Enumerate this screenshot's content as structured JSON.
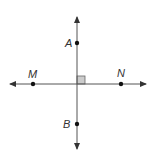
{
  "diagram": {
    "type": "perpendicular-lines",
    "colors": {
      "line": "#555555",
      "point": "#111111",
      "right_angle_fill": "#cccccc",
      "right_angle_stroke": "#666666",
      "label": "#333333"
    },
    "points": [
      {
        "label": "A",
        "x": 77,
        "y": 43,
        "label_x": 66,
        "label_y": 47
      },
      {
        "label": "B",
        "x": 77,
        "y": 124,
        "label_x": 63,
        "label_y": 128
      },
      {
        "label": "M",
        "x": 33,
        "y": 84,
        "label_x": 28,
        "label_y": 78
      },
      {
        "label": "N",
        "x": 121,
        "y": 84,
        "label_x": 117,
        "label_y": 77
      }
    ],
    "lines": [
      {
        "name": "vertical-line-AB",
        "x1": 77,
        "y1": 22,
        "x2": 77,
        "y2": 146
      },
      {
        "name": "horizontal-line-MN",
        "x1": 14,
        "y1": 84,
        "x2": 143,
        "y2": 84
      }
    ],
    "right_angle_marker": {
      "x": 77,
      "y": 76,
      "size": 8
    }
  }
}
